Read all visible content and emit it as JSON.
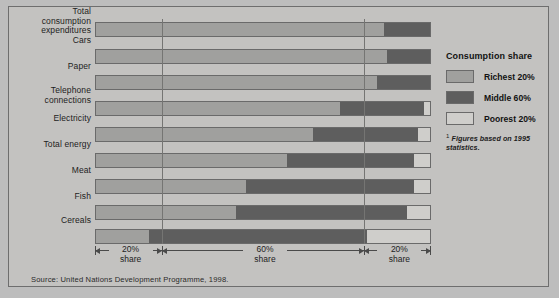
{
  "chart_data": {
    "type": "bar",
    "title": "",
    "orientation": "horizontal",
    "stacked": true,
    "xlabel": "",
    "ylabel": "",
    "xlim": [
      0,
      100
    ],
    "grid": false,
    "legend_position": "right",
    "categories": [
      "Total consumption expenditures",
      "Cars",
      "Paper",
      "Telephone connections",
      "Electricity",
      "Total energy",
      "Meat",
      "Fish",
      "Cereals"
    ],
    "series": [
      {
        "name": "Richest 20%",
        "color": "#a0a09e",
        "values": [
          86,
          87,
          84,
          73,
          65,
          57,
          45,
          42,
          16
        ]
      },
      {
        "name": "Middle 60%",
        "color": "#5e5e5e",
        "values": [
          14,
          13,
          16,
          25,
          31,
          38,
          50,
          51,
          65
        ]
      },
      {
        "name": "Poorest 20%",
        "color": "#cfcecb",
        "values": [
          0,
          0,
          0,
          2,
          4,
          5,
          5,
          7,
          19
        ]
      }
    ],
    "axis_scale": {
      "segments": [
        {
          "label_line1": "20%",
          "label_line2": "share",
          "from": 0,
          "to": 20
        },
        {
          "label_line1": "60%",
          "label_line2": "share",
          "from": 20,
          "to": 80
        },
        {
          "label_line1": "20%",
          "label_line2": "share",
          "from": 80,
          "to": 100
        }
      ]
    },
    "annotations": {
      "source": "Source: United Nations Development Programme, 1998.",
      "footnote_marker": "1",
      "footnote": "Figures based on 1995 statistics."
    }
  },
  "legend": {
    "title": "Consumption share",
    "items": [
      {
        "label": "Richest 20%",
        "swatch": "richest-swatch"
      },
      {
        "label": "Middle 60%",
        "swatch": "middle-swatch"
      },
      {
        "label": "Poorest 20%",
        "swatch": "poorest-swatch"
      }
    ]
  },
  "colors": {
    "richest": "#a0a09e",
    "middle": "#5e5e5e",
    "poorest": "#cfcecb",
    "background": "#c3c2c0",
    "outline": "#6a6a6a"
  }
}
